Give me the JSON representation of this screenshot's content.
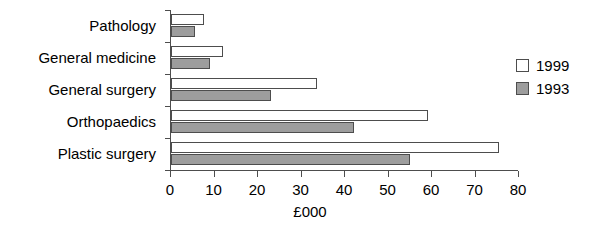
{
  "chart_data": {
    "type": "bar",
    "orientation": "horizontal",
    "title": "",
    "xlabel": "£000",
    "ylabel": "",
    "xlim": [
      0,
      80
    ],
    "xticks": [
      0,
      10,
      20,
      30,
      40,
      50,
      60,
      70,
      80
    ],
    "grid": false,
    "legend_position": "right",
    "categories": [
      "Pathology",
      "General medicine",
      "General surgery",
      "Orthopaedics",
      "Plastic surgery"
    ],
    "series": [
      {
        "name": "1999",
        "color": "#ffffff",
        "values": [
          7.5,
          12,
          33.5,
          59,
          75.5
        ]
      },
      {
        "name": "1993",
        "color": "#9d9d9d",
        "values": [
          5.5,
          9,
          23,
          42,
          55
        ]
      }
    ]
  },
  "axis": {
    "x_tick_labels": [
      "0",
      "10",
      "20",
      "30",
      "40",
      "50",
      "60",
      "70",
      "80"
    ],
    "x_title": "£000"
  },
  "legend": {
    "items": [
      {
        "label": "1999"
      },
      {
        "label": "1993"
      }
    ]
  },
  "colors": {
    "series_1999": "#ffffff",
    "series_1993": "#9d9d9d",
    "axis": "#4d4d4d",
    "text": "#000000",
    "background": "#ffffff"
  }
}
